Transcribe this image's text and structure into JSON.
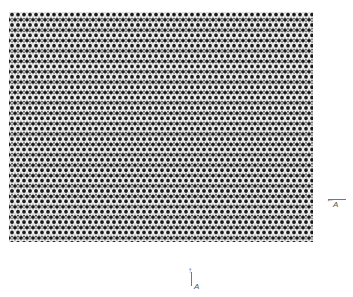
{
  "figure": {
    "colors": {
      "background": "#ffffff",
      "dots": "#1a1a1a",
      "lattice_bg": "#d8d8d8"
    }
  },
  "annotations": {
    "right_arrow": {
      "label": "A",
      "direction": "left"
    },
    "bottom_arrow": {
      "label": "A",
      "direction": "up"
    }
  }
}
